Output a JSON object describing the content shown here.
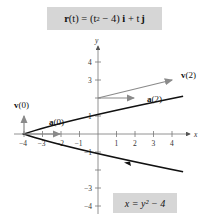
{
  "title_equation": {
    "bold_r": "r",
    "text": "(t) = (t² − 4) i + t j",
    "parts": [
      "r",
      "(t) = (t",
      "2",
      " − 4) ",
      "i",
      " + t",
      "j"
    ]
  },
  "curve_equation": "x = y² − 4",
  "axes": {
    "x_label": "x",
    "y_label": "y",
    "x_ticks": [
      "−4",
      "−3",
      "−2",
      "−1",
      "1",
      "2",
      "3",
      "4"
    ],
    "y_ticks": [
      "4",
      "3",
      "1",
      "−1",
      "−3",
      "−4"
    ]
  },
  "vectors": {
    "v0": "v(0)",
    "a0": "a(0)",
    "v2": "v(2)",
    "a2": "a(2)"
  },
  "colors": {
    "curve": "#111111",
    "vector": "#8a8a8a",
    "box": "#d6d6d6",
    "axis": "#555555"
  }
}
